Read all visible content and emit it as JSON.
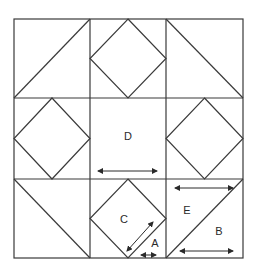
{
  "diagram": {
    "title": "",
    "labels": {
      "A": "A",
      "B": "B",
      "C": "C",
      "D": "D",
      "E": "E"
    },
    "colors": {
      "line": "#3a3a3a",
      "background": "#ffffff"
    }
  }
}
